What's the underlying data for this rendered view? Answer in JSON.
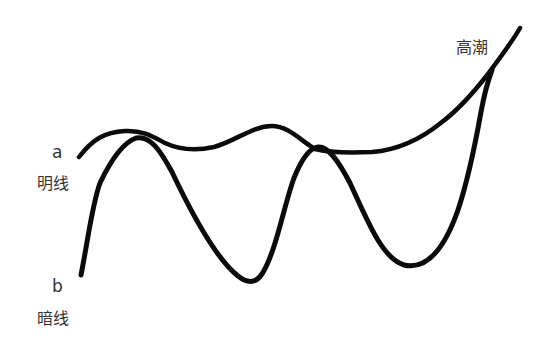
{
  "diagram": {
    "type": "line-sketch",
    "background": "#ffffff",
    "stroke_color": "#0b0b0b",
    "text_color": "#333333",
    "labels": {
      "a_letter": "a",
      "a_text": "明线",
      "b_letter": "b",
      "b_text": "暗线",
      "climax": "高潮"
    },
    "curves": [
      {
        "name": "a",
        "label": "明线",
        "description": "Bright line: gentle undulating curve ending in steep rise",
        "path": "M79,157 C92,140 104,132 125,131 C142,130 152,136 165,143 C180,150 196,151 214,147 C236,141 252,126 272,126 C288,126 300,140 315,149 C330,153 350,153 372,152 C398,150 420,140 442,122 C458,110 474,92 488,74 C500,58 512,42 520,28",
        "stroke_width": 4.5
      },
      {
        "name": "b",
        "label": "暗线",
        "description": "Dark line: large oscillations crossing line a, converging at climax",
        "path": "M81,275 C88,240 92,205 100,183 C110,162 122,143 136,138 C150,135 160,150 172,172 C190,210 215,258 238,276 C248,284 256,283 262,274 C276,252 284,205 294,178 C302,158 310,148 318,147 C328,146 338,160 350,183 C368,222 382,258 404,265 C426,270 444,250 458,210 C468,180 476,140 481,112 C485,90 489,78 492,70",
        "stroke_width": 5
      }
    ],
    "annotations": [
      {
        "text": "a",
        "x": 52,
        "y": 144
      },
      {
        "text": "明线",
        "x": 37,
        "y": 176
      },
      {
        "text": "b",
        "x": 52,
        "y": 278
      },
      {
        "text": "暗线",
        "x": 37,
        "y": 311
      },
      {
        "text": "高潮",
        "x": 456,
        "y": 40
      }
    ]
  }
}
